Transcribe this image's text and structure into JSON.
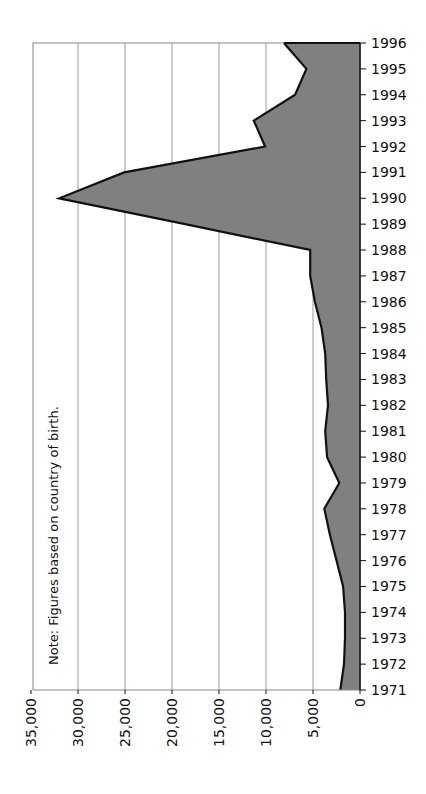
{
  "chart_data": {
    "type": "area",
    "orientation": "rotated-90-clockwise",
    "title": "",
    "xlabel": "Year",
    "ylabel": "",
    "note": "Note: Figures based on country of birth.",
    "categories": [
      "1971",
      "1972",
      "1973",
      "1974",
      "1975",
      "1976",
      "1977",
      "1978",
      "1979",
      "1980",
      "1981",
      "1982",
      "1983",
      "1984",
      "1985",
      "1986",
      "1987",
      "1988",
      "1989",
      "1990",
      "1991",
      "1992",
      "1993",
      "1994",
      "1995",
      "1996"
    ],
    "values": [
      2100,
      1700,
      1600,
      1600,
      1800,
      2500,
      3200,
      3800,
      2200,
      3500,
      3700,
      3400,
      3600,
      3700,
      4100,
      4800,
      5300,
      5300,
      18600,
      32000,
      25100,
      10100,
      11300,
      6900,
      5700,
      8100
    ],
    "value_ticks": [
      "0",
      "5,000",
      "10,000",
      "15,000",
      "20,000",
      "25,000",
      "30,000",
      "35,000"
    ],
    "ylim": [
      0,
      35000
    ],
    "grid": true,
    "fill_color": "#808080",
    "line_color": "#111111",
    "legend": null
  }
}
